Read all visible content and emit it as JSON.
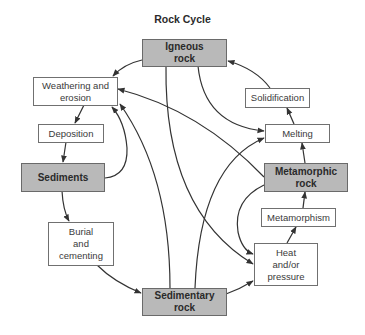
{
  "title": "Rock Cycle",
  "colors": {
    "rock_fill": "#b9b9b9",
    "process_fill": "#ffffff",
    "stroke": "#333333",
    "text": "#3a3a3a"
  },
  "nodes": {
    "igneous": "Igneous\nrock",
    "weathering": "Weathering and\nerosion",
    "deposition": "Deposition",
    "sediments": "Sediments",
    "burial": "Burial\nand\ncementing",
    "sedimentary": "Sedimentary\nrock",
    "heat": "Heat\nand/or\npressure",
    "metamorphism": "Metamorphism",
    "metamorphic": "Metamorphic\nrock",
    "melting": "Melting",
    "solidification": "Solidification"
  },
  "edges": [
    {
      "from": "Igneous rock",
      "to": "Weathering and erosion"
    },
    {
      "from": "Igneous rock",
      "to": "Melting"
    },
    {
      "from": "Igneous rock",
      "to": "Heat and/or pressure"
    },
    {
      "from": "Weathering and erosion",
      "to": "Deposition"
    },
    {
      "from": "Deposition",
      "to": "Sediments"
    },
    {
      "from": "Sediments",
      "to": "Burial and cementing"
    },
    {
      "from": "Sediments",
      "to": "Weathering and erosion"
    },
    {
      "from": "Burial and cementing",
      "to": "Sedimentary rock"
    },
    {
      "from": "Sedimentary rock",
      "to": "Heat and/or pressure"
    },
    {
      "from": "Sedimentary rock",
      "to": "Weathering and erosion"
    },
    {
      "from": "Sedimentary rock",
      "to": "Melting"
    },
    {
      "from": "Heat and/or pressure",
      "to": "Metamorphism"
    },
    {
      "from": "Metamorphism",
      "to": "Metamorphic rock"
    },
    {
      "from": "Metamorphic rock",
      "to": "Melting"
    },
    {
      "from": "Metamorphic rock",
      "to": "Weathering and erosion"
    },
    {
      "from": "Metamorphic rock",
      "to": "Heat and/or pressure"
    },
    {
      "from": "Melting",
      "to": "Solidification"
    },
    {
      "from": "Solidification",
      "to": "Igneous rock"
    }
  ]
}
